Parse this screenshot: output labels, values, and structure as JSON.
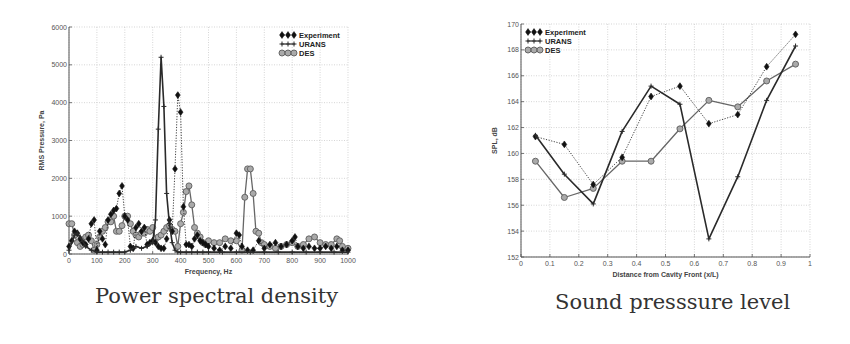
{
  "chart_data": [
    {
      "type": "line",
      "title": "Power spectral density",
      "xlabel": "Frequency, Hz",
      "ylabel": "RMS Pressure, Pa",
      "xlim": [
        0,
        1000
      ],
      "ylim": [
        0,
        6000
      ],
      "xticks": [
        0,
        100,
        200,
        300,
        400,
        500,
        600,
        700,
        800,
        900,
        1000
      ],
      "yticks": [
        0,
        1000,
        2000,
        3000,
        4000,
        5000,
        6000
      ],
      "grid": true,
      "legend_position": "upper right",
      "series": [
        {
          "name": "Experiment",
          "marker": "diamond",
          "line": "dotted",
          "x": [
            0,
            10,
            20,
            30,
            40,
            50,
            60,
            70,
            80,
            90,
            100,
            110,
            120,
            130,
            140,
            150,
            160,
            170,
            180,
            190,
            200,
            210,
            220,
            230,
            240,
            250,
            260,
            270,
            280,
            290,
            300,
            310,
            320,
            330,
            340,
            350,
            360,
            370,
            380,
            390,
            400,
            410,
            420,
            430,
            440,
            450,
            460,
            470,
            480,
            490,
            500,
            520,
            540,
            560,
            580,
            600,
            610,
            620,
            640,
            660,
            680,
            700,
            720,
            740,
            760,
            780,
            800,
            810,
            820,
            840,
            860,
            880,
            900,
            920,
            940,
            960,
            980,
            1000
          ],
          "y": [
            200,
            350,
            600,
            550,
            400,
            300,
            250,
            400,
            800,
            900,
            100,
            600,
            400,
            250,
            900,
            1050,
            1150,
            1200,
            1600,
            1800,
            1000,
            900,
            200,
            150,
            700,
            800,
            600,
            700,
            250,
            300,
            350,
            300,
            200,
            150,
            150,
            400,
            900,
            600,
            2250,
            4200,
            3750,
            1250,
            250,
            250,
            200,
            400,
            500,
            350,
            300,
            250,
            200,
            150,
            100,
            200,
            150,
            550,
            500,
            200,
            100,
            100,
            350,
            150,
            250,
            300,
            200,
            250,
            350,
            450,
            200,
            150,
            200,
            150,
            150,
            200,
            150,
            200,
            100,
            100
          ]
        },
        {
          "name": "URANS",
          "marker": "plus",
          "line": "solid",
          "x": [
            0,
            20,
            30,
            40,
            60,
            80,
            100,
            120,
            140,
            160,
            180,
            200,
            220,
            240,
            260,
            280,
            300,
            310,
            320,
            330,
            340,
            350,
            360,
            370,
            380,
            390,
            400,
            420,
            440,
            460,
            480,
            500,
            550,
            600,
            650,
            700,
            750,
            800,
            850,
            900,
            950,
            1000
          ],
          "y": [
            100,
            500,
            550,
            450,
            200,
            100,
            50,
            50,
            50,
            50,
            50,
            50,
            100,
            200,
            150,
            200,
            300,
            900,
            3300,
            5200,
            3900,
            1600,
            800,
            300,
            100,
            50,
            50,
            50,
            50,
            50,
            50,
            50,
            50,
            50,
            50,
            50,
            50,
            50,
            50,
            50,
            50,
            50
          ]
        },
        {
          "name": "DES",
          "marker": "circle",
          "line": "solid",
          "x": [
            0,
            10,
            20,
            30,
            40,
            50,
            60,
            70,
            80,
            90,
            100,
            110,
            120,
            130,
            140,
            150,
            160,
            170,
            180,
            190,
            200,
            210,
            220,
            230,
            240,
            250,
            260,
            270,
            280,
            290,
            300,
            310,
            320,
            330,
            340,
            350,
            360,
            370,
            380,
            390,
            400,
            410,
            420,
            430,
            440,
            450,
            460,
            470,
            480,
            490,
            500,
            520,
            540,
            560,
            580,
            600,
            620,
            630,
            640,
            650,
            660,
            670,
            680,
            690,
            700,
            720,
            740,
            760,
            780,
            800,
            820,
            840,
            860,
            880,
            900,
            920,
            940,
            960,
            970,
            980,
            1000
          ],
          "y": [
            800,
            800,
            500,
            300,
            200,
            250,
            450,
            500,
            350,
            100,
            250,
            450,
            600,
            700,
            850,
            850,
            1000,
            600,
            600,
            750,
            1000,
            1000,
            800,
            600,
            500,
            450,
            550,
            550,
            650,
            600,
            700,
            400,
            450,
            500,
            600,
            700,
            750,
            650,
            600,
            200,
            800,
            1100,
            1650,
            1800,
            1300,
            700,
            550,
            450,
            300,
            250,
            350,
            300,
            300,
            400,
            350,
            350,
            100,
            1500,
            2250,
            2250,
            1600,
            600,
            550,
            300,
            250,
            200,
            150,
            200,
            250,
            300,
            200,
            250,
            400,
            450,
            300,
            250,
            250,
            400,
            350,
            200,
            150
          ]
        }
      ]
    },
    {
      "type": "line",
      "title": "Sound presssure level",
      "xlabel": "Distance from Cavity Front (x/L)",
      "ylabel": "SPL, dB",
      "xlim": [
        0,
        1
      ],
      "ylim": [
        152,
        170
      ],
      "xticks": [
        0,
        0.1,
        0.2,
        0.3,
        0.4,
        0.5,
        0.6,
        0.7,
        0.8,
        0.9,
        1
      ],
      "yticks": [
        152,
        154,
        156,
        158,
        160,
        162,
        164,
        166,
        168,
        170
      ],
      "grid": true,
      "legend_position": "upper left",
      "x": [
        0.05,
        0.15,
        0.25,
        0.35,
        0.45,
        0.55,
        0.65,
        0.75,
        0.85,
        0.95
      ],
      "series": [
        {
          "name": "Experiment",
          "marker": "diamond",
          "line": "dotted",
          "values": [
            161.3,
            160.7,
            157.6,
            159.7,
            164.4,
            165.2,
            162.3,
            163.0,
            166.7,
            169.2
          ]
        },
        {
          "name": "URANS",
          "marker": "plus",
          "line": "solid",
          "values": [
            161.4,
            158.4,
            156.1,
            161.7,
            165.2,
            163.8,
            153.4,
            158.2,
            164.1,
            168.3
          ]
        },
        {
          "name": "DES",
          "marker": "circle",
          "line": "solid",
          "values": [
            159.4,
            156.6,
            157.3,
            159.4,
            159.4,
            161.9,
            164.1,
            163.6,
            165.6,
            166.9
          ]
        }
      ]
    }
  ],
  "captions": {
    "left": "Power spectral density",
    "right": "Sound presssure level"
  },
  "legend": {
    "experiment": "Experiment",
    "urans": "URANS",
    "des": "DES"
  },
  "axes": {
    "left_xlabel": "Frequency, Hz",
    "left_ylabel": "RMS Pressure, Pa",
    "right_xlabel": "Distance from Cavity Front (x/L)",
    "right_ylabel": "SPL, dB"
  },
  "colors": {
    "experiment": "#111111",
    "urans": "#2a2a2a",
    "des": "#666666",
    "des_fill": "#aaaaaa",
    "grid": "#bbbbbb"
  }
}
